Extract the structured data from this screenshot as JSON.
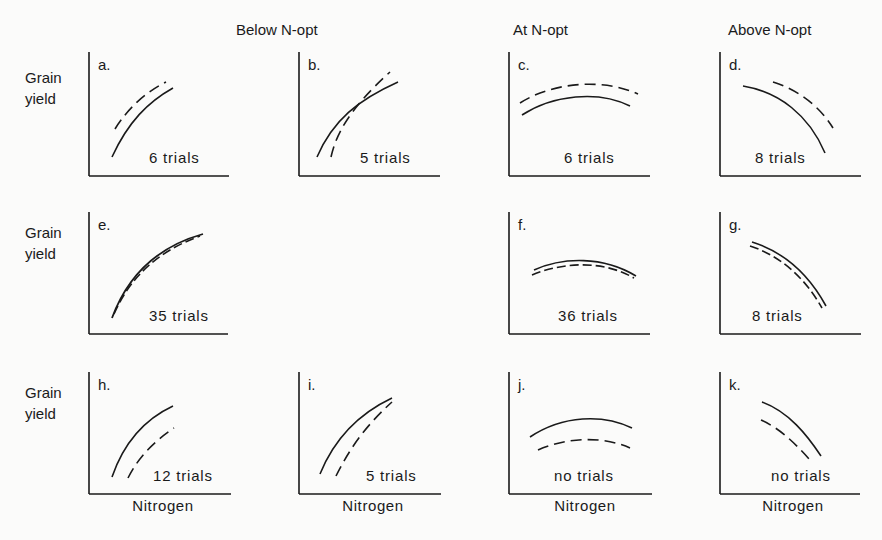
{
  "figure": {
    "column_headers": [
      "Below N-opt",
      "At N-opt",
      "Above N-opt"
    ],
    "y_axis_label": [
      "Grain",
      "yield"
    ],
    "x_axis_label": "Nitrogen",
    "panels": [
      {
        "id": "a",
        "letter": "a.",
        "trials": "6 trials"
      },
      {
        "id": "b",
        "letter": "b.",
        "trials": "5 trials"
      },
      {
        "id": "c",
        "letter": "c.",
        "trials": "6 trials"
      },
      {
        "id": "d",
        "letter": "d.",
        "trials": "8 trials"
      },
      {
        "id": "e",
        "letter": "e.",
        "trials": "35 trials"
      },
      {
        "id": "f",
        "letter": "f.",
        "trials": "36 trials"
      },
      {
        "id": "g",
        "letter": "g.",
        "trials": "8 trials"
      },
      {
        "id": "h",
        "letter": "h.",
        "trials": "12 trials"
      },
      {
        "id": "i",
        "letter": "i.",
        "trials": "5 trials"
      },
      {
        "id": "j",
        "letter": "j.",
        "trials": "no trials"
      },
      {
        "id": "k",
        "letter": "k.",
        "trials": "no trials"
      }
    ]
  },
  "legend_semantics": {
    "solid": "response curve (line style A)",
    "dashed": "response curve (line style B)"
  },
  "colors": {
    "ink": "#1a1a1a",
    "background": "#fbfbfa"
  }
}
